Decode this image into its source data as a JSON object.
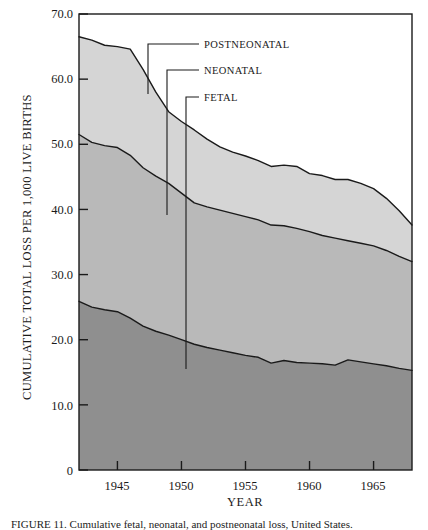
{
  "chart_data": {
    "type": "area",
    "title": "",
    "xlabel": "YEAR",
    "ylabel": "CUMULATIVE TOTAL LOSS PER 1,000 LIVE BIRTHS",
    "xlim": [
      1942,
      1968
    ],
    "ylim": [
      0,
      70
    ],
    "grid": false,
    "legend_position": "inline-leader-lines",
    "stacked": true,
    "x": [
      1942,
      1943,
      1944,
      1945,
      1946,
      1947,
      1948,
      1949,
      1950,
      1951,
      1952,
      1953,
      1954,
      1955,
      1956,
      1957,
      1958,
      1959,
      1960,
      1961,
      1962,
      1963,
      1964,
      1965,
      1966,
      1967,
      1968
    ],
    "series": [
      {
        "name": "FETAL",
        "color": "#8f8f8f",
        "note": "bottom band; values are the fetal loss rate per 1,000 live births",
        "values": [
          25.9,
          25.0,
          24.6,
          24.3,
          23.3,
          22.1,
          21.3,
          20.7,
          20.0,
          19.3,
          18.8,
          18.4,
          18.0,
          17.6,
          17.3,
          16.4,
          16.8,
          16.5,
          16.4,
          16.3,
          16.1,
          16.9,
          16.6,
          16.3,
          16.0,
          15.6,
          15.3
        ]
      },
      {
        "name": "NEONATAL",
        "color": "#b9b9b9",
        "note": "middle band; cumulative top edge = fetal + neonatal",
        "cumulative_top": [
          51.5,
          50.3,
          49.8,
          49.5,
          48.3,
          46.4,
          45.1,
          44.0,
          42.5,
          41.0,
          40.4,
          39.9,
          39.4,
          38.9,
          38.4,
          37.6,
          37.5,
          37.1,
          36.6,
          36.0,
          35.6,
          35.2,
          34.8,
          34.4,
          33.7,
          32.8,
          32.0
        ],
        "values": [
          25.6,
          25.3,
          25.2,
          25.2,
          25.0,
          24.3,
          23.8,
          23.3,
          22.5,
          21.7,
          21.6,
          21.5,
          21.4,
          21.3,
          21.1,
          21.2,
          20.7,
          20.6,
          20.2,
          19.7,
          19.5,
          18.3,
          18.2,
          18.1,
          17.7,
          17.2,
          16.7
        ]
      },
      {
        "name": "POSTNEONATAL",
        "color": "#d5d5d5",
        "note": "top band; cumulative top edge = total loss",
        "cumulative_top": [
          66.5,
          66.0,
          65.2,
          65.0,
          64.6,
          61.5,
          58.0,
          55.0,
          53.5,
          52.2,
          50.8,
          49.6,
          48.8,
          48.2,
          47.5,
          46.6,
          46.8,
          46.6,
          45.5,
          45.2,
          44.6,
          44.6,
          44.0,
          43.2,
          41.7,
          39.8,
          37.6
        ],
        "values": [
          15.0,
          15.7,
          15.4,
          15.5,
          16.3,
          15.1,
          12.9,
          11.0,
          11.0,
          11.2,
          10.4,
          9.7,
          9.4,
          9.3,
          9.1,
          9.0,
          9.3,
          9.5,
          8.9,
          9.2,
          9.0,
          9.4,
          9.2,
          8.8,
          8.0,
          7.0,
          5.6
        ]
      }
    ],
    "y_ticks": [
      {
        "value": 0,
        "label": "0"
      },
      {
        "value": 10,
        "label": "10.0"
      },
      {
        "value": 20,
        "label": "20.0"
      },
      {
        "value": 30,
        "label": "30.0"
      },
      {
        "value": 40,
        "label": "40.0"
      },
      {
        "value": 50,
        "label": "50.0"
      },
      {
        "value": 60,
        "label": "60.0"
      },
      {
        "value": 70,
        "label": "70.0"
      }
    ],
    "x_ticks": [
      {
        "value": 1945,
        "label": "1945"
      },
      {
        "value": 1950,
        "label": "1950"
      },
      {
        "value": 1955,
        "label": "1955"
      },
      {
        "value": 1960,
        "label": "1960"
      },
      {
        "value": 1965,
        "label": "1965"
      }
    ],
    "annotations": [
      {
        "label": "POSTNEONATAL",
        "target_series": "POSTNEONATAL"
      },
      {
        "label": "NEONATAL",
        "target_series": "NEONATAL"
      },
      {
        "label": "FETAL",
        "target_series": "FETAL"
      }
    ]
  },
  "labels": {
    "postneonatal": "POSTNEONATAL",
    "neonatal": "NEONATAL",
    "fetal": "FETAL",
    "y_axis_title": "CUMULATIVE TOTAL LOSS PER 1,000 LIVE BIRTHS",
    "x_axis_title": "YEAR",
    "y_0": "0",
    "y_10": "10.0",
    "y_20": "20.0",
    "y_30": "30.0",
    "y_40": "40.0",
    "y_50": "50.0",
    "y_60": "60.0",
    "y_70": "70.0",
    "x_1945": "1945",
    "x_1950": "1950",
    "x_1955": "1955",
    "x_1960": "1960",
    "x_1965": "1965"
  },
  "caption": {
    "text": "FIGURE 11.  Cumulative fetal, neonatal, and postneonatal loss, United States."
  },
  "colors": {
    "fetal_fill": "#8f8f8f",
    "neonatal_fill": "#b9b9b9",
    "postneonatal_fill": "#d5d5d5",
    "line": "#1a1a1a",
    "background": "#ffffff"
  }
}
